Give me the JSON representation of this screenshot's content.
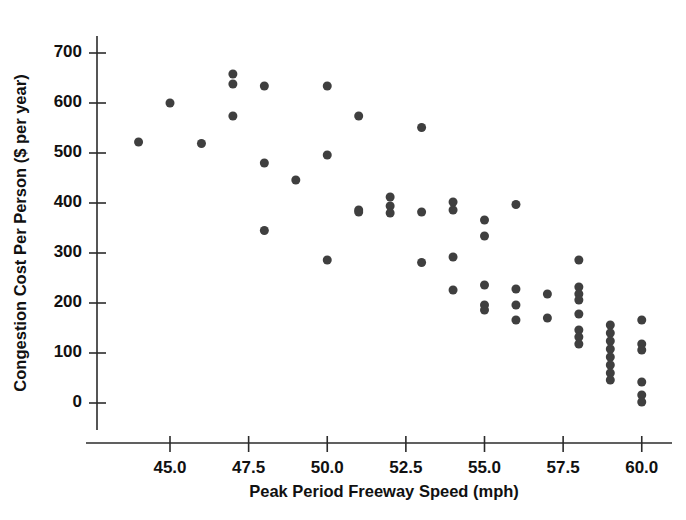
{
  "chart_data": {
    "type": "scatter",
    "title": "",
    "xlabel": "Peak Period Freeway Speed (mph)",
    "ylabel": "Congestion Cost Per Person ($ per year)",
    "xlim": [
      43.2,
      61.0
    ],
    "ylim": [
      -30,
      730
    ],
    "xticks": [
      45.0,
      47.5,
      50.0,
      52.5,
      55.0,
      57.5,
      60.0
    ],
    "xtick_labels": [
      "45.0",
      "47.5",
      "50.0",
      "52.5",
      "55.0",
      "57.5",
      "60.0"
    ],
    "yticks": [
      0,
      100,
      200,
      300,
      400,
      500,
      600,
      700
    ],
    "ytick_labels": [
      "0",
      "100",
      "200",
      "300",
      "400",
      "500",
      "600",
      "700"
    ],
    "grid": false,
    "legend": null,
    "marker_color": "#3f3f3f",
    "marker_size": 9,
    "points": [
      {
        "x": 44.0,
        "y": 522
      },
      {
        "x": 45.0,
        "y": 600
      },
      {
        "x": 46.0,
        "y": 519
      },
      {
        "x": 47.0,
        "y": 658
      },
      {
        "x": 47.0,
        "y": 638
      },
      {
        "x": 47.0,
        "y": 574
      },
      {
        "x": 48.0,
        "y": 634
      },
      {
        "x": 48.0,
        "y": 480
      },
      {
        "x": 48.0,
        "y": 345
      },
      {
        "x": 49.0,
        "y": 446
      },
      {
        "x": 50.0,
        "y": 634
      },
      {
        "x": 50.0,
        "y": 496
      },
      {
        "x": 50.0,
        "y": 286
      },
      {
        "x": 51.0,
        "y": 574
      },
      {
        "x": 51.0,
        "y": 386
      },
      {
        "x": 51.0,
        "y": 382
      },
      {
        "x": 52.0,
        "y": 412
      },
      {
        "x": 52.0,
        "y": 394
      },
      {
        "x": 52.0,
        "y": 380
      },
      {
        "x": 53.0,
        "y": 551
      },
      {
        "x": 53.0,
        "y": 382
      },
      {
        "x": 53.0,
        "y": 281
      },
      {
        "x": 54.0,
        "y": 402
      },
      {
        "x": 54.0,
        "y": 386
      },
      {
        "x": 54.0,
        "y": 292
      },
      {
        "x": 54.0,
        "y": 226
      },
      {
        "x": 55.0,
        "y": 366
      },
      {
        "x": 55.0,
        "y": 334
      },
      {
        "x": 55.0,
        "y": 236
      },
      {
        "x": 55.0,
        "y": 196
      },
      {
        "x": 55.0,
        "y": 186
      },
      {
        "x": 56.0,
        "y": 397
      },
      {
        "x": 56.0,
        "y": 228
      },
      {
        "x": 56.0,
        "y": 196
      },
      {
        "x": 56.0,
        "y": 166
      },
      {
        "x": 57.0,
        "y": 218
      },
      {
        "x": 57.0,
        "y": 170
      },
      {
        "x": 58.0,
        "y": 286
      },
      {
        "x": 58.0,
        "y": 232
      },
      {
        "x": 58.0,
        "y": 218
      },
      {
        "x": 58.0,
        "y": 206
      },
      {
        "x": 58.0,
        "y": 178
      },
      {
        "x": 58.0,
        "y": 146
      },
      {
        "x": 58.0,
        "y": 132
      },
      {
        "x": 58.0,
        "y": 118
      },
      {
        "x": 59.0,
        "y": 156
      },
      {
        "x": 59.0,
        "y": 140
      },
      {
        "x": 59.0,
        "y": 124
      },
      {
        "x": 59.0,
        "y": 108
      },
      {
        "x": 59.0,
        "y": 92
      },
      {
        "x": 59.0,
        "y": 76
      },
      {
        "x": 59.0,
        "y": 60
      },
      {
        "x": 59.0,
        "y": 46
      },
      {
        "x": 60.0,
        "y": 166
      },
      {
        "x": 60.0,
        "y": 118
      },
      {
        "x": 60.0,
        "y": 106
      },
      {
        "x": 60.0,
        "y": 42
      },
      {
        "x": 60.0,
        "y": 16
      },
      {
        "x": 60.0,
        "y": 2
      }
    ]
  }
}
